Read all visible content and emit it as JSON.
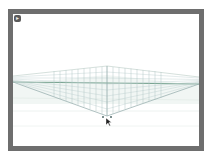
{
  "viewport": {
    "frame_color": "#6e6e6e",
    "background": "#ffffff"
  },
  "corner_button": {
    "glyph": "▸",
    "icon": "play-icon"
  },
  "perspective_grid": {
    "type": "two-point",
    "line_color": "#9fb8b8",
    "horizon_color": "#7aa592",
    "ground_color": "#d8e4df"
  },
  "cursor": {
    "icon": "arrow-pointer-icon"
  }
}
